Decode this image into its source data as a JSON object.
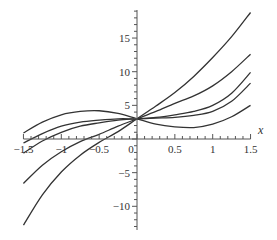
{
  "chart_data": {
    "type": "line",
    "title": "",
    "xlabel": "x",
    "ylabel": "",
    "xlim": [
      -1.5,
      1.5
    ],
    "ylim": [
      -13,
      19
    ],
    "grid": false,
    "legend": null,
    "x_ticks": [
      "-1.5",
      "-1",
      "-0.5",
      "0",
      "0.5",
      "1",
      "1.5"
    ],
    "y_ticks": [
      "-10",
      "-5",
      "5",
      "10",
      "15"
    ],
    "x": [
      -1.5,
      -1.25,
      -1.0,
      -0.75,
      -0.5,
      -0.25,
      0,
      0.25,
      0.5,
      0.75,
      1.0,
      1.25,
      1.5
    ],
    "series": [
      {
        "name": "curve-1",
        "values": [
          -12.8,
          -8.3,
          -4.9,
          -2.4,
          -0.5,
          1.1,
          3.0,
          4.9,
          6.9,
          9.3,
          12.1,
          15.2,
          18.8
        ]
      },
      {
        "name": "curve-2",
        "values": [
          -6.6,
          -3.9,
          -1.9,
          -0.4,
          0.7,
          1.9,
          3.0,
          4.1,
          5.3,
          6.4,
          7.9,
          10.0,
          12.6
        ]
      },
      {
        "name": "curve-3",
        "values": [
          -2.1,
          -0.3,
          1.0,
          1.9,
          2.4,
          2.8,
          3.0,
          3.2,
          3.6,
          4.1,
          5.0,
          6.8,
          9.9
        ]
      },
      {
        "name": "curve-4",
        "values": [
          -0.6,
          0.8,
          1.9,
          2.5,
          2.8,
          3.0,
          3.0,
          3.1,
          3.2,
          3.5,
          4.1,
          5.6,
          8.3
        ]
      },
      {
        "name": "curve-5",
        "values": [
          0.9,
          2.5,
          3.6,
          4.1,
          4.2,
          3.8,
          3.0,
          2.2,
          1.8,
          1.7,
          2.2,
          3.3,
          5.0
        ]
      }
    ]
  }
}
